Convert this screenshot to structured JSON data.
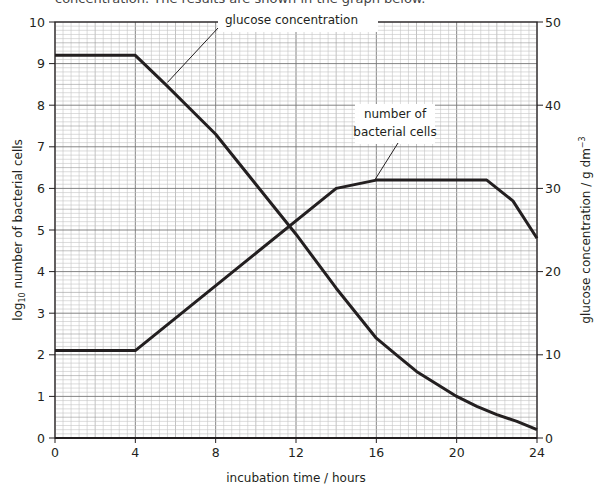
{
  "header_fragment": "concentration. The results are shown in the graph below.",
  "chart_data": {
    "type": "line",
    "title": "",
    "xlabel": "incubation time / hours",
    "ylabel_left": "log10 number of bacterial cells",
    "ylabel_right": "glucose concentration / g dm-3",
    "xlim": [
      0,
      24
    ],
    "ylim_left": [
      0,
      10
    ],
    "ylim_right": [
      0,
      50
    ],
    "x_ticks": [
      0,
      4,
      8,
      12,
      16,
      20,
      24
    ],
    "y_ticks_left": [
      0,
      1,
      2,
      3,
      4,
      5,
      6,
      7,
      8,
      9,
      10
    ],
    "y_ticks_right": [
      0,
      10,
      20,
      30,
      40,
      50
    ],
    "grid": true,
    "series": [
      {
        "name": "number of bacterial cells",
        "axis": "left",
        "x": [
          0,
          4,
          14,
          16,
          21.5,
          22.8,
          24
        ],
        "values": [
          2.1,
          2.1,
          6.0,
          6.2,
          6.2,
          5.7,
          4.8
        ]
      },
      {
        "name": "glucose concentration",
        "axis": "right",
        "x": [
          0,
          4,
          5.5,
          8,
          10,
          12,
          14,
          16,
          17,
          18,
          19,
          20,
          21,
          22,
          23,
          24
        ],
        "values": [
          46,
          46,
          42.5,
          36.5,
          30.5,
          24.5,
          18,
          12,
          10,
          8,
          6.5,
          5,
          3.8,
          2.8,
          2,
          1
        ]
      }
    ],
    "annotations": [
      {
        "text": "glucose concentration",
        "points_to_x": 5.5
      },
      {
        "text": "number of bacterial cells",
        "points_to_x": 16
      }
    ]
  }
}
